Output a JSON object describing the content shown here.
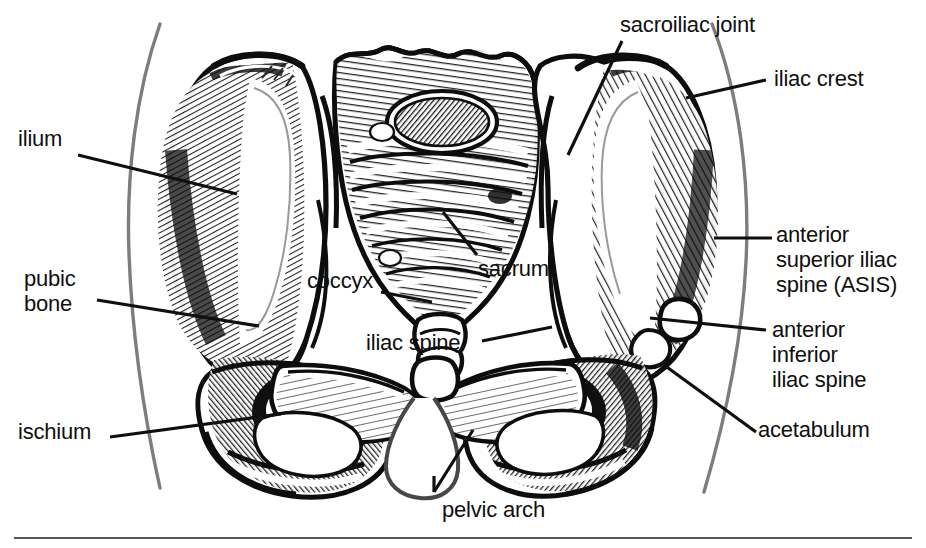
{
  "figure": {
    "ink_color": "#100f0f",
    "body_outline_color": "#7a7a7a",
    "rule_color": "#575757",
    "background": "#ffffff",
    "width": 926,
    "height": 548
  },
  "labels": {
    "sacroiliac_joint": "sacroiliac joint",
    "iliac_crest": "iliac crest",
    "ilium": "ilium",
    "anterior_superior_iliac_spine": "anterior\nsuperior iliac\nspine (ASIS)",
    "pubic_bone": "pubic\nbone",
    "coccyx": "coccyx",
    "sacrum": "sacrum",
    "iliac_spine": "iliac spine",
    "anterior_inferior_iliac_spine": "anterior\ninferior\niliac spine",
    "ischium": "ischium",
    "acetabulum": "acetabulum",
    "pelvic_arch": "pelvic arch"
  },
  "leader_lines": [
    {
      "name": "ilium-leader",
      "x1": 78,
      "y1": 155,
      "x2": 237,
      "y2": 194
    },
    {
      "name": "sacroiliac-joint-leader",
      "x1": 622,
      "y1": 41,
      "x2": 568,
      "y2": 155
    },
    {
      "name": "iliac-crest-leader",
      "x1": 766,
      "y1": 80,
      "x2": 686,
      "y2": 98
    },
    {
      "name": "anterior-superior-iliac-spine-leader",
      "x1": 772,
      "y1": 238,
      "x2": 714,
      "y2": 238
    },
    {
      "name": "pubic-bone-leader",
      "x1": 97,
      "y1": 300,
      "x2": 259,
      "y2": 326
    },
    {
      "name": "coccyx-leader",
      "x1": 381,
      "y1": 292,
      "x2": 432,
      "y2": 302
    },
    {
      "name": "sacrum-leader",
      "x1": 477,
      "y1": 255,
      "x2": 443,
      "y2": 212
    },
    {
      "name": "iliac-spine-leader",
      "x1": 482,
      "y1": 341,
      "x2": 552,
      "y2": 327
    },
    {
      "name": "anterior-inferior-iliac-spine-leader",
      "x1": 766,
      "y1": 330,
      "x2": 650,
      "y2": 318
    },
    {
      "name": "ischium-leader",
      "x1": 110,
      "y1": 437,
      "x2": 281,
      "y2": 414
    },
    {
      "name": "acetabulum-leader",
      "x1": 756,
      "y1": 432,
      "x2": 664,
      "y2": 365
    },
    {
      "name": "pelvic-arch-leader",
      "x1": 434,
      "y1": 492,
      "x2": 473,
      "y2": 430
    },
    {
      "name": "pelvic-arch-tick",
      "x1": 434,
      "y1": 492,
      "x2": 434,
      "y2": 476
    }
  ],
  "label_positions": {
    "sacroiliac_joint": {
      "left": 620,
      "top": 12
    },
    "iliac_crest": {
      "left": 774,
      "top": 66
    },
    "ilium": {
      "left": 18,
      "top": 126
    },
    "anterior_superior_iliac_spine": {
      "left": 776,
      "top": 222
    },
    "pubic_bone": {
      "left": 24,
      "top": 266
    },
    "coccyx": {
      "left": 307,
      "top": 268
    },
    "sacrum": {
      "left": 478,
      "top": 256
    },
    "iliac_spine": {
      "left": 366,
      "top": 330
    },
    "anterior_inferior_iliac_spine": {
      "left": 772,
      "top": 317
    },
    "ischium": {
      "left": 18,
      "top": 419
    },
    "acetabulum": {
      "left": 758,
      "top": 417
    },
    "pelvic_arch": {
      "left": 442,
      "top": 497
    }
  }
}
